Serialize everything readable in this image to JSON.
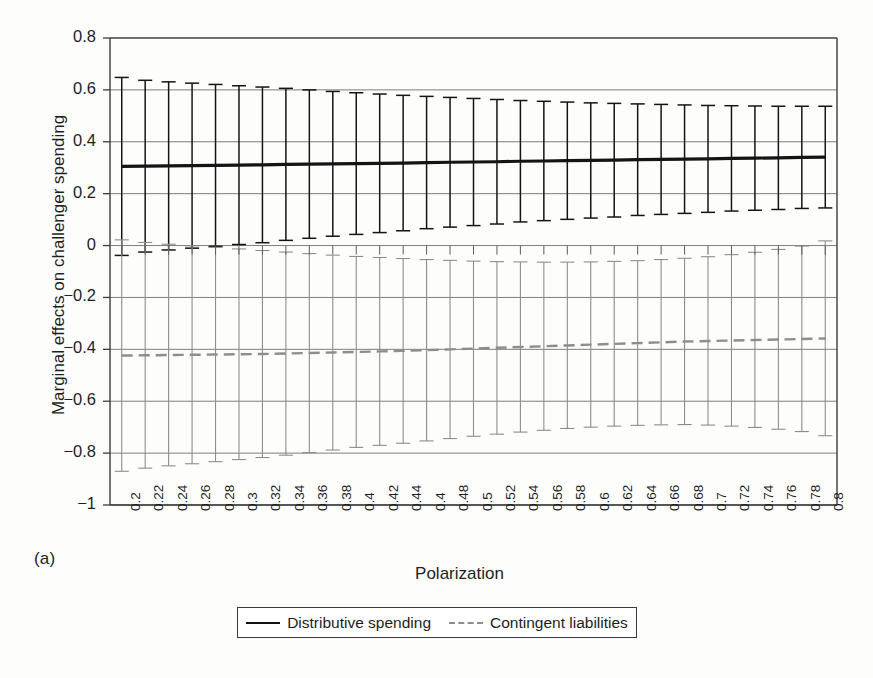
{
  "figure": {
    "panel_label": "(a)",
    "background_color": "#fdfdfc"
  },
  "chart_data": {
    "type": "line",
    "title": "",
    "subtitle": "",
    "xlabel": "Polarization",
    "ylabel": "Marginal effects on challenger spending",
    "xlim": [
      0.19,
      0.81
    ],
    "ylim": [
      -1.0,
      0.8
    ],
    "yticks": [
      0.8,
      0.6,
      0.4,
      0.2,
      0,
      -0.2,
      -0.4,
      -0.6,
      -0.8,
      -1
    ],
    "ytick_labels": [
      "0.8",
      "0.6",
      "0.4",
      "0.2",
      "0",
      "-0.2",
      "-0.4",
      "-0.6",
      "-0.8",
      "-1"
    ],
    "grid": true,
    "grid_axis": "y",
    "legend_position": "bottom-center",
    "categories": [
      0.2,
      0.22,
      0.24,
      0.26,
      0.28,
      0.3,
      0.32,
      0.34,
      0.36,
      0.38,
      0.4,
      0.42,
      0.44,
      0.46,
      0.48,
      0.5,
      0.52,
      0.54,
      0.56,
      0.58,
      0.6,
      0.62,
      0.64,
      0.66,
      0.68,
      0.7,
      0.72,
      0.74,
      0.76,
      0.78,
      0.8
    ],
    "xtick_labels": [
      "0.2",
      "0.22",
      "0.24",
      "0.26",
      "0.28",
      "0.3",
      "0.32",
      "0.34",
      "0.36",
      "0.38",
      "0.4",
      "0.42",
      "0.44",
      "0.4",
      "0.48",
      "0.5",
      "0.52",
      "0.54",
      "0.56",
      "0.58",
      "0.6",
      "0.62",
      "0.64",
      "0.66",
      "0.68",
      "0.7",
      "0.72",
      "0.74",
      "0.76",
      "0.78",
      "0.8"
    ],
    "series": [
      {
        "name": "Distributive spending",
        "color": "#141414",
        "linestyle": "solid",
        "error_bars": true,
        "values": [
          0.305,
          0.306,
          0.307,
          0.308,
          0.309,
          0.31,
          0.311,
          0.313,
          0.314,
          0.315,
          0.316,
          0.317,
          0.318,
          0.32,
          0.321,
          0.322,
          0.323,
          0.325,
          0.326,
          0.327,
          0.328,
          0.329,
          0.331,
          0.332,
          0.333,
          0.334,
          0.336,
          0.337,
          0.338,
          0.34,
          0.341
        ],
        "ci_upper": [
          0.648,
          0.637,
          0.631,
          0.626,
          0.621,
          0.616,
          0.611,
          0.606,
          0.6,
          0.594,
          0.589,
          0.584,
          0.579,
          0.575,
          0.571,
          0.567,
          0.563,
          0.559,
          0.556,
          0.553,
          0.55,
          0.548,
          0.546,
          0.544,
          0.542,
          0.54,
          0.539,
          0.538,
          0.537,
          0.537,
          0.537
        ],
        "ci_lower": [
          -0.038,
          -0.025,
          -0.017,
          -0.01,
          -0.003,
          0.004,
          0.011,
          0.02,
          0.028,
          0.036,
          0.043,
          0.05,
          0.057,
          0.065,
          0.071,
          0.077,
          0.083,
          0.091,
          0.096,
          0.101,
          0.106,
          0.11,
          0.116,
          0.12,
          0.124,
          0.128,
          0.133,
          0.136,
          0.139,
          0.143,
          0.145
        ]
      },
      {
        "name": "Contingent liabilities",
        "color": "#8d8d8d",
        "linestyle": "dashed",
        "error_bars": true,
        "values": [
          -0.424,
          -0.423,
          -0.422,
          -0.421,
          -0.42,
          -0.419,
          -0.418,
          -0.416,
          -0.414,
          -0.412,
          -0.41,
          -0.408,
          -0.406,
          -0.403,
          -0.4,
          -0.397,
          -0.394,
          -0.391,
          -0.388,
          -0.385,
          -0.382,
          -0.379,
          -0.376,
          -0.373,
          -0.37,
          -0.368,
          -0.366,
          -0.364,
          -0.362,
          -0.36,
          -0.358
        ],
        "ci_upper": [
          0.022,
          0.012,
          0.005,
          -0.001,
          -0.007,
          -0.013,
          -0.019,
          -0.025,
          -0.031,
          -0.037,
          -0.042,
          -0.046,
          -0.05,
          -0.054,
          -0.057,
          -0.06,
          -0.062,
          -0.063,
          -0.064,
          -0.064,
          -0.063,
          -0.061,
          -0.058,
          -0.054,
          -0.049,
          -0.043,
          -0.035,
          -0.026,
          -0.015,
          -0.002,
          0.018
        ],
        "ci_lower": [
          -0.87,
          -0.858,
          -0.849,
          -0.841,
          -0.833,
          -0.825,
          -0.817,
          -0.808,
          -0.798,
          -0.788,
          -0.778,
          -0.77,
          -0.762,
          -0.753,
          -0.744,
          -0.735,
          -0.727,
          -0.719,
          -0.712,
          -0.705,
          -0.7,
          -0.696,
          -0.693,
          -0.691,
          -0.69,
          -0.692,
          -0.696,
          -0.701,
          -0.708,
          -0.717,
          -0.733
        ]
      }
    ]
  },
  "legend": {
    "items": [
      {
        "label": "Distributive spending",
        "style": "solid",
        "color": "#141414"
      },
      {
        "label": "Contingent liabilities",
        "style": "dashed",
        "color": "#8d8d8d"
      }
    ]
  }
}
